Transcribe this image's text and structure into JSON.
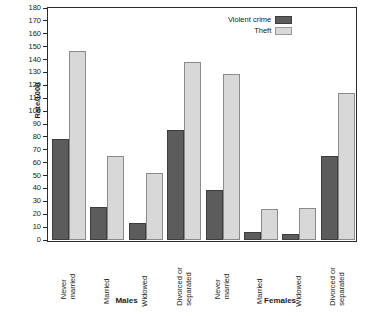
{
  "chart_data": {
    "type": "bar",
    "title": "",
    "xlabel": "",
    "ylabel": "Rate/1000",
    "ylim": [
      0,
      180
    ],
    "yticks": [
      0,
      10,
      20,
      30,
      40,
      50,
      60,
      70,
      80,
      90,
      100,
      110,
      120,
      130,
      140,
      150,
      160,
      170,
      180
    ],
    "grid": false,
    "legend_position": "top-right",
    "categories": [
      "Never married",
      "Married",
      "Widowed",
      "Divorced or separated",
      "Never married",
      "Married",
      "Widowed",
      "Divorced or separated"
    ],
    "category_lines": [
      [
        "Never",
        "married"
      ],
      [
        "Married"
      ],
      [
        "Widowed"
      ],
      [
        "Divorced or",
        "separated"
      ],
      [
        "Never",
        "married"
      ],
      [
        "Married"
      ],
      [
        "Widowed"
      ],
      [
        "Divorced or",
        "separated"
      ]
    ],
    "groups": [
      {
        "label": "Males",
        "categories": [
          0,
          1,
          2,
          3
        ]
      },
      {
        "label": "Females",
        "categories": [
          4,
          5,
          6,
          7
        ]
      }
    ],
    "series": [
      {
        "name": "Violent crime",
        "color": "#5c5c5c",
        "values": [
          78,
          26,
          13,
          85,
          39,
          6,
          5,
          65
        ]
      },
      {
        "name": "Theft",
        "color": "#d8d8d8",
        "values": [
          147,
          65,
          52,
          138,
          129,
          24,
          25,
          114
        ]
      }
    ]
  },
  "legend": {
    "items": [
      {
        "label": "Violent crime",
        "swatch": "violent"
      },
      {
        "label": "Theft",
        "swatch": "theft"
      }
    ]
  },
  "axis": {
    "y_title": "Rate/1000"
  }
}
